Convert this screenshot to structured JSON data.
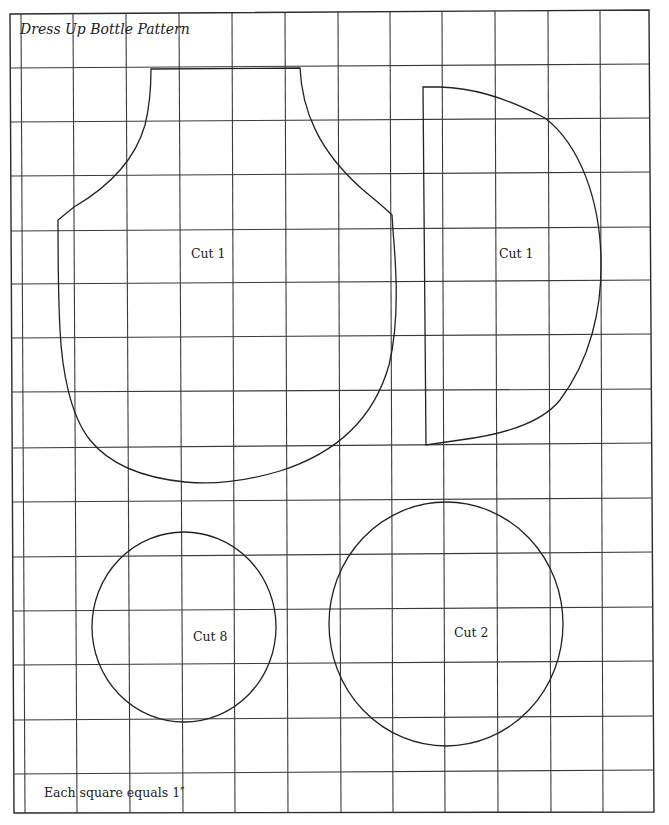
{
  "title": "Dress Up Bottle Pattern",
  "scale_note": "Each square equals 1″",
  "grid": {
    "unit": "1 inch per square",
    "columns_x": [
      22,
      74,
      127,
      180,
      232,
      285,
      338,
      390,
      442,
      495,
      548,
      600
    ],
    "rows_y": [
      68,
      122,
      176,
      231,
      284,
      338,
      392,
      448,
      502,
      557,
      611,
      665,
      720,
      774
    ],
    "border": {
      "left": 10,
      "top": 14,
      "right": 652,
      "bottom": 813
    }
  },
  "pieces": [
    {
      "id": "body-front",
      "shape": "bottle-body",
      "label": "Cut 1"
    },
    {
      "id": "half-circle-piece",
      "shape": "d-shape",
      "label": "Cut 1"
    },
    {
      "id": "small-circle",
      "shape": "circle",
      "label": "Cut 8"
    },
    {
      "id": "large-circle",
      "shape": "circle",
      "label": "Cut 2"
    }
  ],
  "colors": {
    "line": "#222222",
    "grid": "#3a3a3a",
    "background": "#ffffff"
  }
}
